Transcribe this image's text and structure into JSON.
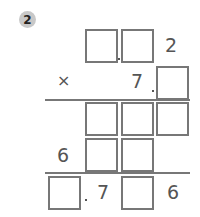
{
  "problem": {
    "number": "2",
    "row1": {
      "digit": "2"
    },
    "row2": {
      "operator": "×",
      "digit": "7"
    },
    "row4": {
      "digit": "6"
    },
    "row5": {
      "digit1": "7",
      "digit2": "6"
    }
  }
}
